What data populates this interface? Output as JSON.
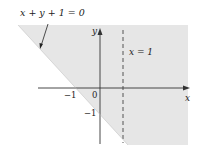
{
  "figure": {
    "equation_label": "x + y + 1 = 0",
    "vertical_line_label": "x = 1",
    "x_axis_label": "x",
    "y_axis_label": "y",
    "origin_label": "0",
    "x_tick_label": "−1",
    "y_tick_label": "−1",
    "colors": {
      "shade": "#e6e6e6",
      "axis": "#333333",
      "line": "#444444"
    }
  }
}
